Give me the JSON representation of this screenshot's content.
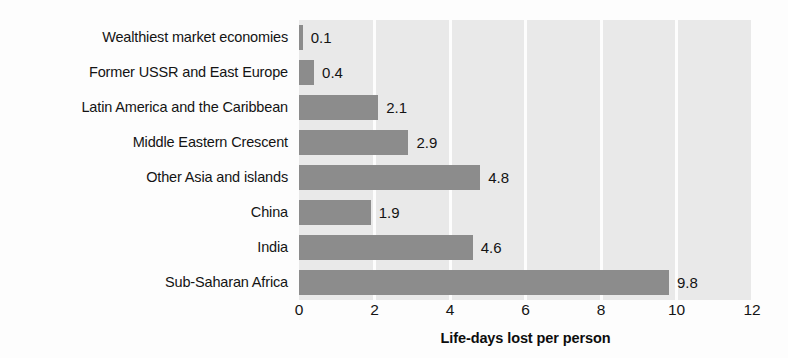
{
  "chart_data": {
    "type": "bar",
    "orientation": "horizontal",
    "title": "",
    "xlabel": "Life-days lost per person",
    "ylabel": "",
    "xlim": [
      0,
      12
    ],
    "xticks": [
      0,
      2,
      4,
      6,
      8,
      10,
      12
    ],
    "xtick_labels": [
      "0",
      "2",
      "4",
      "6",
      "8",
      "10",
      "12"
    ],
    "grid": "vertical-white-gridlines",
    "legend": "none",
    "plot_background": "#e9e9e9",
    "bar_color": "#8c8c8c",
    "categories": [
      "Wealthiest market economies",
      "Former USSR and East Europe",
      "Latin America and the Caribbean",
      "Middle Eastern Crescent",
      "Other Asia and islands",
      "China",
      "India",
      "Sub-Saharan Africa"
    ],
    "values": [
      0.1,
      0.4,
      2.1,
      2.9,
      4.8,
      1.9,
      4.6,
      9.8
    ],
    "value_labels": [
      "0.1",
      "0.4",
      "2.1",
      "2.9",
      "4.8",
      "1.9",
      "4.6",
      "9.8"
    ]
  }
}
